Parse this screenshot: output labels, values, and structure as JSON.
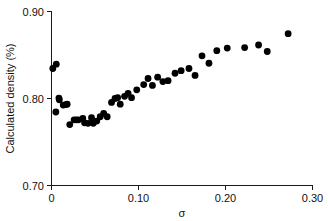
{
  "chart_data": {
    "type": "scatter",
    "title": "",
    "xlabel": "σ",
    "ylabel": "Calculated density (%)",
    "xlim": [
      0.0,
      0.3
    ],
    "ylim": [
      0.7,
      0.9
    ],
    "grid": false,
    "legend": null,
    "xticks": [
      {
        "value": 0.0,
        "label": "0"
      },
      {
        "value": 0.1,
        "label": "0.10"
      },
      {
        "value": 0.2,
        "label": "0.20"
      },
      {
        "value": 0.3,
        "label": "0.30"
      }
    ],
    "yticks": [
      {
        "value": 0.7,
        "label": "0.70"
      },
      {
        "value": 0.8,
        "label": "0.80"
      },
      {
        "value": 0.9,
        "label": "0.90"
      }
    ],
    "marker": {
      "shape": "circle",
      "color": "#000000",
      "size": 3.4
    },
    "series": [
      {
        "name": "calculated density",
        "points": [
          [
            0.0015,
            0.8345
          ],
          [
            0.0055,
            0.8395
          ],
          [
            0.005,
            0.7845
          ],
          [
            0.0085,
            0.8005
          ],
          [
            0.009,
            0.7985
          ],
          [
            0.0135,
            0.7925
          ],
          [
            0.0165,
            0.793
          ],
          [
            0.018,
            0.7935
          ],
          [
            0.021,
            0.77
          ],
          [
            0.026,
            0.7755
          ],
          [
            0.0285,
            0.7755
          ],
          [
            0.031,
            0.7755
          ],
          [
            0.036,
            0.777
          ],
          [
            0.038,
            0.772
          ],
          [
            0.042,
            0.7715
          ],
          [
            0.046,
            0.778
          ],
          [
            0.048,
            0.7715
          ],
          [
            0.052,
            0.774
          ],
          [
            0.056,
            0.779
          ],
          [
            0.06,
            0.783
          ],
          [
            0.064,
            0.779
          ],
          [
            0.069,
            0.7955
          ],
          [
            0.073,
            0.8
          ],
          [
            0.076,
            0.801
          ],
          [
            0.079,
            0.7935
          ],
          [
            0.084,
            0.8025
          ],
          [
            0.088,
            0.806
          ],
          [
            0.092,
            0.801
          ],
          [
            0.098,
            0.81
          ],
          [
            0.106,
            0.816
          ],
          [
            0.111,
            0.823
          ],
          [
            0.116,
            0.815
          ],
          [
            0.122,
            0.8245
          ],
          [
            0.128,
            0.8195
          ],
          [
            0.134,
            0.8205
          ],
          [
            0.142,
            0.829
          ],
          [
            0.149,
            0.832
          ],
          [
            0.158,
            0.8345
          ],
          [
            0.165,
            0.8265
          ],
          [
            0.173,
            0.849
          ],
          [
            0.181,
            0.8405
          ],
          [
            0.19,
            0.855
          ],
          [
            0.202,
            0.858
          ],
          [
            0.222,
            0.8585
          ],
          [
            0.238,
            0.8615
          ],
          [
            0.248,
            0.854
          ],
          [
            0.272,
            0.8745
          ]
        ]
      }
    ]
  }
}
